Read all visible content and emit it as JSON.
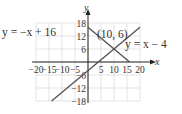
{
  "chart_data": {
    "type": "line",
    "title": "",
    "xlabel": "x",
    "ylabel": "y",
    "xlim": [
      -20,
      20
    ],
    "ylim": [
      -18,
      18
    ],
    "grid": true,
    "x_ticks": [
      -20,
      -15,
      -10,
      -5,
      5,
      10,
      15,
      20
    ],
    "x_tick_labels": [
      "−20",
      "−15",
      "−10",
      "−5",
      "5",
      "10",
      "15",
      "20"
    ],
    "y_ticks": [
      18,
      12,
      6,
      -6,
      -12,
      -18
    ],
    "y_tick_labels": [
      "18",
      "12",
      "6",
      "−6",
      "−12",
      "−18"
    ],
    "series": [
      {
        "name": "y = −x + 16",
        "equation": "y=-x+16",
        "points": [
          [
            0,
            16
          ],
          [
            16,
            0
          ]
        ]
      },
      {
        "name": "y = x − 4",
        "equation": "y=x-4",
        "points": [
          [
            -14,
            -18
          ],
          [
            20,
            16
          ]
        ]
      }
    ],
    "annotations": [
      {
        "text": "(10, 6)",
        "x": 10,
        "y": 6,
        "role": "intersection"
      }
    ]
  },
  "labels": {
    "line1": "y = −x + 16",
    "line2": "y = x − 4",
    "intersection": "(10, 6)",
    "x_axis": "x",
    "y_axis": "y"
  }
}
